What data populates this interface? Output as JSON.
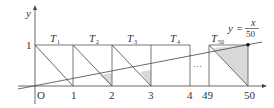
{
  "axes": {
    "x_label": "x",
    "y_label": "y",
    "origin_label": "O",
    "y_tick_label": "1",
    "x_tick_labels": [
      "1",
      "2",
      "3",
      "4",
      "49",
      "50"
    ]
  },
  "triangles": [
    {
      "label": "T",
      "sub": "1"
    },
    {
      "label": "T",
      "sub": "2"
    },
    {
      "label": "T",
      "sub": "3"
    },
    {
      "label": "T",
      "sub": "4"
    },
    {
      "label": "T",
      "sub": "50"
    }
  ],
  "ellipsis": "···",
  "line_equation": {
    "lhs": "y =",
    "numerator": "x",
    "denominator": "50"
  },
  "colors": {
    "stroke": "#444444",
    "shade": "#d9d9d9"
  }
}
